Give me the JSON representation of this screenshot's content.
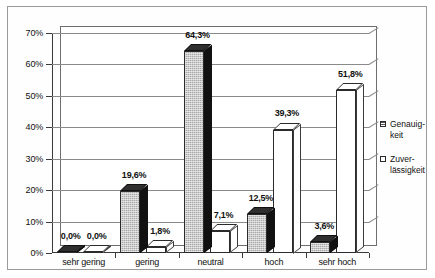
{
  "chart_data": {
    "type": "bar",
    "title": "",
    "xlabel": "",
    "ylabel": "",
    "categories": [
      "sehr gering",
      "gering",
      "neutral",
      "hoch",
      "sehr hoch"
    ],
    "series": [
      {
        "name": "Genauigkeit",
        "legend_label_line1": "Genauig-",
        "legend_label_line2": "keit",
        "marker": "filled-hatched-square",
        "values": [
          0.0,
          19.6,
          64.3,
          12.5,
          3.6
        ],
        "labels": [
          "0,0%",
          "19,6%",
          "64,3%",
          "12,5%",
          "3,6%"
        ]
      },
      {
        "name": "Zuverlässigkeit",
        "legend_label_line1": "Zuver-",
        "legend_label_line2": "lässigkeit",
        "marker": "open-square",
        "values": [
          0.0,
          1.8,
          7.1,
          39.3,
          51.8
        ],
        "labels": [
          "0,0%",
          "1,8%",
          "7,1%",
          "39,3%",
          "51,8%"
        ]
      }
    ],
    "ylim": [
      0,
      70
    ],
    "ytick_values": [
      0,
      10,
      20,
      30,
      40,
      50,
      60,
      70
    ],
    "ytick_labels": [
      "0%",
      "10%",
      "20%",
      "30%",
      "40%",
      "50%",
      "60%",
      "70%"
    ],
    "grid": true,
    "legend_position": "right",
    "colors": {
      "series_genauigkeit": "#a8a8a8",
      "series_zuverlaessigkeit": "#ffffff",
      "gridline": "#8a8a8a",
      "axis": "#3a3a3a",
      "frame": "#9a9a9a",
      "background": "#ffffff",
      "text": "#111111"
    }
  }
}
